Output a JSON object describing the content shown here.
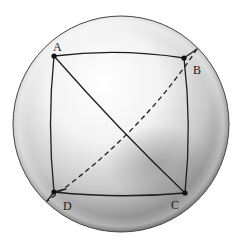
{
  "figure": {
    "sphere": {
      "cx": 121,
      "cy": 124,
      "r": 108,
      "edge_color": "#3a3a3a"
    },
    "points": [
      {
        "id": "A",
        "label": "A",
        "x": 54,
        "y": 56,
        "label_x": 53,
        "label_y": 51
      },
      {
        "id": "B",
        "label": "B",
        "x": 184,
        "y": 58,
        "label_x": 193,
        "label_y": 74
      },
      {
        "id": "C",
        "label": "C",
        "x": 185,
        "y": 193,
        "label_x": 171,
        "label_y": 209
      },
      {
        "id": "D",
        "label": "D",
        "x": 54,
        "y": 192,
        "label_x": 63,
        "label_y": 210
      }
    ],
    "edges": [
      {
        "from": "A",
        "to": "B",
        "style": "solid"
      },
      {
        "from": "B",
        "to": "C",
        "style": "solid"
      },
      {
        "from": "C",
        "to": "D",
        "style": "solid"
      },
      {
        "from": "D",
        "to": "A",
        "style": "solid"
      },
      {
        "from": "A",
        "to": "C",
        "style": "solid"
      },
      {
        "from": "B",
        "to": "D",
        "style": "dashed"
      }
    ],
    "line_color": "#1e1e1e"
  }
}
